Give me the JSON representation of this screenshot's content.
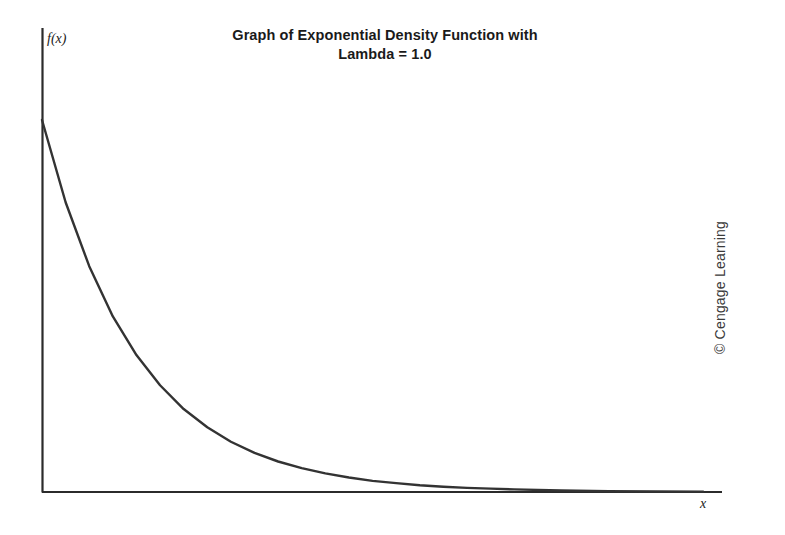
{
  "title": {
    "lines": [
      "Graph of Exponential Density Function with",
      "Lambda = 1.0"
    ]
  },
  "labels": {
    "y_axis": "f(x)",
    "x_axis": "x"
  },
  "credit": {
    "text": "© Cengage Learning"
  },
  "colors": {
    "curve": "#333333",
    "axis": "#2b2b2b",
    "background": "#ffffff",
    "title_text": "#1a1a1a"
  },
  "chart_data": {
    "type": "line",
    "title": "Graph of Exponential Density Function with Lambda = 1.0",
    "xlabel": "x",
    "ylabel": "f(x)",
    "lambda": 1.0,
    "function": "f(x) = lambda * exp(-lambda * x)",
    "xlim": [
      0,
      7.2
    ],
    "ylim": [
      0,
      1.08
    ],
    "grid": false,
    "legend": null,
    "tick_labels": {
      "x": [],
      "y": []
    },
    "x": [
      0,
      0.25,
      0.5,
      0.75,
      1,
      1.25,
      1.5,
      1.75,
      2,
      2.25,
      2.5,
      2.75,
      3,
      3.25,
      3.5,
      3.75,
      4,
      4.25,
      4.5,
      4.75,
      5,
      5.5,
      6,
      6.5,
      7
    ],
    "values": [
      1.0,
      0.779,
      0.607,
      0.472,
      0.368,
      0.287,
      0.223,
      0.174,
      0.135,
      0.105,
      0.082,
      0.064,
      0.05,
      0.039,
      0.03,
      0.024,
      0.018,
      0.014,
      0.011,
      0.009,
      0.007,
      0.004,
      0.002,
      0.0015,
      0.001
    ],
    "series": [
      {
        "name": "exponential density",
        "values": [
          1.0,
          0.779,
          0.607,
          0.472,
          0.368,
          0.287,
          0.223,
          0.174,
          0.135,
          0.105,
          0.082,
          0.064,
          0.05,
          0.039,
          0.03,
          0.024,
          0.018,
          0.014,
          0.011,
          0.009,
          0.007,
          0.004,
          0.002,
          0.0015,
          0.001
        ]
      }
    ],
    "annotations": [
      "© Cengage Learning"
    ]
  }
}
